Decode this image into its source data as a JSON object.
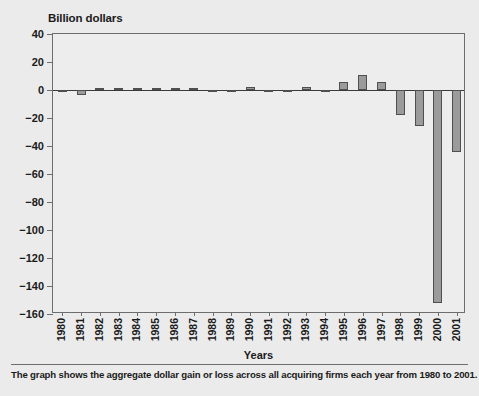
{
  "chart_data": {
    "type": "bar",
    "title": "",
    "ylabel": "Billion dollars",
    "xlabel": "Years",
    "ylim": [
      -160,
      40
    ],
    "ytick_step": 20,
    "yticks": [
      40,
      20,
      0,
      -20,
      -40,
      -60,
      -80,
      -100,
      -120,
      -140,
      -160
    ],
    "ytick_labels": [
      "40",
      "20",
      "0",
      "−20",
      "−40",
      "−60",
      "−80",
      "−100",
      "−120",
      "−140",
      "−160"
    ],
    "grid": false,
    "legend": null,
    "categories": [
      "1980",
      "1981",
      "1982",
      "1983",
      "1984",
      "1985",
      "1986",
      "1987",
      "1988",
      "1989",
      "1990",
      "1991",
      "1992",
      "1993",
      "1994",
      "1995",
      "1996",
      "1997",
      "1998",
      "1999",
      "2000",
      "2001"
    ],
    "values": [
      -1.5,
      -3.5,
      1,
      1,
      1,
      1,
      1,
      1,
      -1,
      -1,
      2,
      -0.5,
      -1,
      2,
      -1.5,
      6,
      11,
      6,
      -18,
      -26,
      -152,
      -44
    ],
    "annotation": "The graph shows the aggregate dollar gain or loss across all acquiring firms each year from 1980 to 2001.",
    "bar_color": "#9b9b9b",
    "bar_edge_color": "#4f4f4f",
    "plot_background": "#ededed",
    "page_background": "#ebebeb",
    "axis_color": "#6d6d6d"
  }
}
